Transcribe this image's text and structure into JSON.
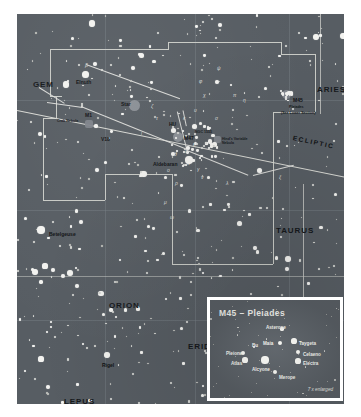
{
  "chart": {
    "background_color": "#575d63",
    "star_color": "#f3f3f0",
    "border_color": "#ffffff",
    "boundary_color": "#c9cbc6",
    "ecliptic_label": "ECLIPTIC"
  },
  "constellations": [
    {
      "name": "GEM",
      "x": 16,
      "y": 66
    },
    {
      "name": "ARIES",
      "x": 300,
      "y": 71
    },
    {
      "name": "TAURUS",
      "x": 259,
      "y": 212
    },
    {
      "name": "ORION",
      "x": 92,
      "y": 287
    },
    {
      "name": "ERIDANUS",
      "x": 171,
      "y": 328
    },
    {
      "name": "LEPUS",
      "x": 47,
      "y": 383
    },
    {
      "name": "CET",
      "x": 334,
      "y": 231
    }
  ],
  "named_stars": [
    {
      "name": "Elnath",
      "x": 68,
      "y": 60,
      "label_dx": -9,
      "label_dy": 5,
      "mag_px": 7.0
    },
    {
      "name": "Aldebaran",
      "x": 172,
      "y": 146,
      "label_dx": -36,
      "label_dy": 1,
      "mag_px": 8.5
    },
    {
      "name": "Betelgeuse",
      "x": 24,
      "y": 216,
      "label_dx": 8,
      "label_dy": 1,
      "mag_px": 7.5
    },
    {
      "name": "Rigel",
      "x": 90,
      "y": 341,
      "label_dx": -5,
      "label_dy": 7,
      "mag_px": 6.5
    }
  ],
  "deep_sky_objects": [
    {
      "name": "M1",
      "sub": "Crab Nebula",
      "x": 64,
      "y": 105
    },
    {
      "name": "M45",
      "sub": "Pleiades",
      "x": 277,
      "y": 88,
      "note": "(See Lower Section)"
    },
    {
      "name": "NGC 1555",
      "sub": "Hind's Variable Nebula",
      "x": 193,
      "y": 122
    },
    {
      "name": "Hyades",
      "sub": "",
      "x": 160,
      "y": 113,
      "short": "HU"
    },
    {
      "name": "M47",
      "sub": "",
      "x": 163,
      "y": 126
    },
    {
      "name": "V18",
      "sub": "",
      "x": 80,
      "y": 126
    },
    {
      "name": "Star",
      "sub": "",
      "x": 118,
      "y": 92
    }
  ],
  "inset": {
    "title": "M45 – Pleiades",
    "scale_note": "7 x enlarged",
    "stars": [
      {
        "name": "Asterope",
        "x": 72,
        "y": 29,
        "r": 1.6,
        "label_dx": -16,
        "label_dy": -4
      },
      {
        "name": "Taygeta",
        "x": 84,
        "y": 41,
        "r": 2.6,
        "label_dx": 5,
        "label_dy": 0
      },
      {
        "name": "Maia",
        "x": 70,
        "y": 43,
        "r": 2.2,
        "label_dx": -17,
        "label_dy": -2
      },
      {
        "name": "Celaeno",
        "x": 88,
        "y": 52,
        "r": 2.0,
        "label_dx": 5,
        "label_dy": 0
      },
      {
        "name": "Electra",
        "x": 88,
        "y": 61,
        "r": 2.6,
        "label_dx": 5,
        "label_dy": 0
      },
      {
        "name": "Pleione",
        "x": 33,
        "y": 53,
        "r": 2.0,
        "label_dx": -17,
        "label_dy": -2
      },
      {
        "name": "Atlas",
        "x": 35,
        "y": 60,
        "r": 2.6,
        "label_dx": -14,
        "label_dy": 1
      },
      {
        "name": "Alcyone",
        "x": 55,
        "y": 60,
        "r": 3.6,
        "label_dx": -13,
        "label_dy": 7
      },
      {
        "name": "Merope",
        "x": 65,
        "y": 72,
        "r": 2.4,
        "label_dx": 4,
        "label_dy": 3
      },
      {
        "name": "Bu",
        "x": 44,
        "y": 47,
        "r": 1.2,
        "label_dx": -2,
        "label_dy": -4
      }
    ]
  },
  "greek_letters": [
    {
      "g": "β",
      "x": 68,
      "y": 48
    },
    {
      "g": "ζ",
      "x": 134,
      "y": 89
    },
    {
      "g": "τ",
      "x": 139,
      "y": 101
    },
    {
      "g": "ι",
      "x": 124,
      "y": 116
    },
    {
      "g": "κ",
      "x": 166,
      "y": 101
    },
    {
      "g": "υ",
      "x": 177,
      "y": 93
    },
    {
      "g": "ψ",
      "x": 200,
      "y": 51
    },
    {
      "g": "φ",
      "x": 182,
      "y": 64
    },
    {
      "g": "χ",
      "x": 186,
      "y": 78
    },
    {
      "g": "σ",
      "x": 198,
      "y": 101
    },
    {
      "g": "π",
      "x": 216,
      "y": 78
    },
    {
      "g": "η",
      "x": 226,
      "y": 83
    },
    {
      "g": "θ",
      "x": 157,
      "y": 137
    },
    {
      "g": "γ",
      "x": 180,
      "y": 152
    },
    {
      "g": "δ",
      "x": 168,
      "y": 134
    },
    {
      "g": "ε",
      "x": 176,
      "y": 127
    },
    {
      "g": "α",
      "x": 170,
      "y": 146
    },
    {
      "g": "λ",
      "x": 209,
      "y": 166
    },
    {
      "g": "ν",
      "x": 184,
      "y": 160
    },
    {
      "g": "ο",
      "x": 150,
      "y": 153
    },
    {
      "g": "ξ",
      "x": 262,
      "y": 160
    },
    {
      "g": "ρ",
      "x": 158,
      "y": 166
    },
    {
      "g": "μ",
      "x": 147,
      "y": 185
    },
    {
      "g": "ω",
      "x": 153,
      "y": 200
    }
  ]
}
